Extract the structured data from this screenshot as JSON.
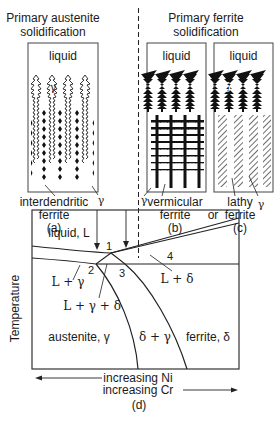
{
  "top": {
    "left_title_1": "Primary austenite",
    "left_title_2": "solidification",
    "right_title_1": "Primary ferrite",
    "right_title_2": "solidification"
  },
  "panels": {
    "a": {
      "liquid": "liquid",
      "gamma": "γ",
      "label_1": "interdendritic",
      "label_2": "ferrite",
      "gamma_pointer": "γ",
      "caption": "(a)"
    },
    "b": {
      "liquid": "liquid",
      "delta": "δ",
      "gamma_pointer": "γ",
      "label_1": "vermicular",
      "label_2": "ferrite",
      "caption": "(b)"
    },
    "or": "or",
    "c": {
      "liquid": "liquid",
      "delta": "δ",
      "label_1": "lathy",
      "label_2": "ferrite",
      "gamma_pointer": "γ",
      "caption": "(c)"
    }
  },
  "phase_diagram": {
    "ylabel": "Temperature",
    "regions": {
      "liquid": "liquid, L",
      "l_gamma": "L + γ",
      "l_gamma_delta": "L + γ + δ",
      "l_delta": "L + δ",
      "austenite": "austenite, γ",
      "delta_gamma": "δ + γ",
      "ferrite": "ferrite, δ"
    },
    "points": [
      "1",
      "2",
      "3",
      "4"
    ],
    "x_axis_1": "increasing Ni",
    "x_axis_2": "increasing Cr",
    "caption": "(d)"
  }
}
